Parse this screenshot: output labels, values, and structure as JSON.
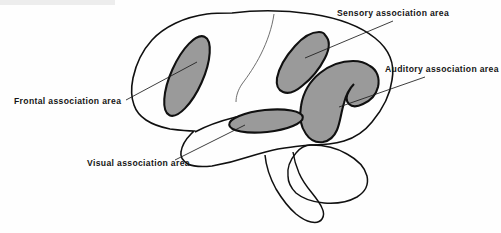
{
  "figure": {
    "background_color": "#fefefe",
    "outline_color": "#101010",
    "shaded_area_fill": "#9a9a9a",
    "label_text_color": "#151515"
  },
  "labels": {
    "frontal": {
      "text": "Frontal association area",
      "x": 14,
      "y": 104
    },
    "sensory": {
      "text": "Sensory association area",
      "x": 337,
      "y": 16
    },
    "auditory": {
      "text": "Auditory association area",
      "x": 385,
      "y": 72
    },
    "visual": {
      "text": "Visual association area",
      "x": 87,
      "y": 166
    }
  },
  "regions": [
    {
      "name": "frontal-association-area",
      "shape": "elongated-ellipse",
      "fill": "#9a9a9a"
    },
    {
      "name": "sensory-association-area",
      "shape": "teardrop",
      "fill": "#9a9a9a"
    },
    {
      "name": "auditory-association-area",
      "shape": "hook",
      "fill": "#9a9a9a"
    },
    {
      "name": "visual-association-area",
      "shape": "flat-ellipse",
      "fill": "#9a9a9a"
    }
  ],
  "anatomy": [
    {
      "name": "cerebrum-outline"
    },
    {
      "name": "cerebellum-outline"
    },
    {
      "name": "brainstem-outline"
    },
    {
      "name": "central-sulcus"
    },
    {
      "name": "lateral-sulcus"
    }
  ]
}
